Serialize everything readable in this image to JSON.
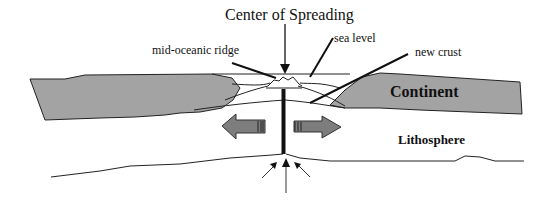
{
  "diagram": {
    "title": "Center of Spreading",
    "labels": {
      "ridge": "mid-oceanic ridge",
      "sea_level": "sea level",
      "new_crust": "new crust",
      "continent": "Continent",
      "lithosphere": "Lithosphere"
    },
    "colors": {
      "continent_fill": "#a3a3a3",
      "arrow_fill": "#7d7d7d",
      "line": "#111111"
    }
  }
}
